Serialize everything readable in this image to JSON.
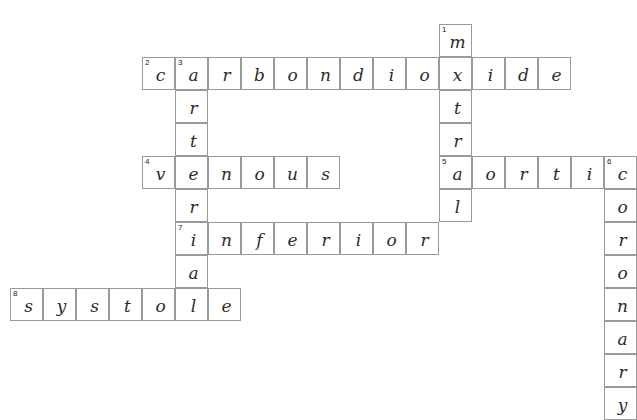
{
  "puzzle": {
    "title": "Cardiovascular crossword grid",
    "cell_size": 33,
    "grid_color": "#9a9a9a",
    "letter_color": "#2b2b2b",
    "background": "#ffffff",
    "entries": [
      {
        "number": 1,
        "direction": "down",
        "answer": "mitral",
        "start": {
          "col": 9,
          "row": 0
        }
      },
      {
        "number": 2,
        "direction": "across",
        "answer": "carbondioxide",
        "start": {
          "col": 0,
          "row": 1
        }
      },
      {
        "number": 3,
        "direction": "down",
        "answer": "arterial",
        "start": {
          "col": 1,
          "row": 1
        }
      },
      {
        "number": 4,
        "direction": "across",
        "answer": "venous",
        "start": {
          "col": 0,
          "row": 4
        }
      },
      {
        "number": 5,
        "direction": "across",
        "answer": "aortic",
        "start": {
          "col": 9,
          "row": 4
        }
      },
      {
        "number": 6,
        "direction": "down",
        "answer": "coronary",
        "start": {
          "col": 13,
          "row": 4
        }
      },
      {
        "number": 7,
        "direction": "across",
        "answer": "inferior",
        "start": {
          "col": 1,
          "row": 6
        }
      },
      {
        "number": 8,
        "direction": "across",
        "answer": "systole",
        "start": {
          "col": -4,
          "row": 8
        }
      }
    ],
    "cells": [
      {
        "col": 9,
        "row": 0,
        "letter": "m",
        "number": 1
      },
      {
        "col": 0,
        "row": 1,
        "letter": "c",
        "number": 2
      },
      {
        "col": 1,
        "row": 1,
        "letter": "a",
        "number": 3
      },
      {
        "col": 2,
        "row": 1,
        "letter": "r",
        "number": null
      },
      {
        "col": 3,
        "row": 1,
        "letter": "b",
        "number": null
      },
      {
        "col": 4,
        "row": 1,
        "letter": "o",
        "number": null
      },
      {
        "col": 5,
        "row": 1,
        "letter": "n",
        "number": null
      },
      {
        "col": 6,
        "row": 1,
        "letter": "d",
        "number": null
      },
      {
        "col": 7,
        "row": 1,
        "letter": "i",
        "number": null
      },
      {
        "col": 8,
        "row": 1,
        "letter": "o",
        "number": null
      },
      {
        "col": 9,
        "row": 1,
        "letter": "x",
        "number": null
      },
      {
        "col": 10,
        "row": 1,
        "letter": "i",
        "number": null
      },
      {
        "col": 11,
        "row": 1,
        "letter": "d",
        "number": null
      },
      {
        "col": 12,
        "row": 1,
        "letter": "e",
        "number": null
      },
      {
        "col": 1,
        "row": 2,
        "letter": "r",
        "number": null
      },
      {
        "col": 9,
        "row": 2,
        "letter": "t",
        "number": null
      },
      {
        "col": 1,
        "row": 3,
        "letter": "t",
        "number": null
      },
      {
        "col": 9,
        "row": 3,
        "letter": "r",
        "number": null
      },
      {
        "col": 0,
        "row": 4,
        "letter": "v",
        "number": 4
      },
      {
        "col": 1,
        "row": 4,
        "letter": "e",
        "number": null
      },
      {
        "col": 2,
        "row": 4,
        "letter": "n",
        "number": null
      },
      {
        "col": 3,
        "row": 4,
        "letter": "o",
        "number": null
      },
      {
        "col": 4,
        "row": 4,
        "letter": "u",
        "number": null
      },
      {
        "col": 5,
        "row": 4,
        "letter": "s",
        "number": null
      },
      {
        "col": 9,
        "row": 4,
        "letter": "a",
        "number": 5
      },
      {
        "col": 10,
        "row": 4,
        "letter": "o",
        "number": null
      },
      {
        "col": 11,
        "row": 4,
        "letter": "r",
        "number": null
      },
      {
        "col": 12,
        "row": 4,
        "letter": "t",
        "number": null
      },
      {
        "col": 13,
        "row": 4,
        "letter": "i",
        "number": null
      },
      {
        "col": 14,
        "row": 4,
        "letter": "c",
        "number": 6
      },
      {
        "col": 1,
        "row": 5,
        "letter": "r",
        "number": null
      },
      {
        "col": 9,
        "row": 5,
        "letter": "l",
        "number": null
      },
      {
        "col": 14,
        "row": 5,
        "letter": "o",
        "number": null
      },
      {
        "col": 1,
        "row": 6,
        "letter": "i",
        "number": 7
      },
      {
        "col": 2,
        "row": 6,
        "letter": "n",
        "number": null
      },
      {
        "col": 3,
        "row": 6,
        "letter": "f",
        "number": null
      },
      {
        "col": 4,
        "row": 6,
        "letter": "e",
        "number": null
      },
      {
        "col": 5,
        "row": 6,
        "letter": "r",
        "number": null
      },
      {
        "col": 6,
        "row": 6,
        "letter": "i",
        "number": null
      },
      {
        "col": 7,
        "row": 6,
        "letter": "o",
        "number": null
      },
      {
        "col": 8,
        "row": 6,
        "letter": "r",
        "number": null
      },
      {
        "col": 14,
        "row": 6,
        "letter": "r",
        "number": null
      },
      {
        "col": 1,
        "row": 7,
        "letter": "a",
        "number": null
      },
      {
        "col": 14,
        "row": 7,
        "letter": "o",
        "number": null
      },
      {
        "col": -4,
        "row": 8,
        "letter": "s",
        "number": 8
      },
      {
        "col": -3,
        "row": 8,
        "letter": "y",
        "number": null
      },
      {
        "col": -2,
        "row": 8,
        "letter": "s",
        "number": null
      },
      {
        "col": -1,
        "row": 8,
        "letter": "t",
        "number": null
      },
      {
        "col": 0,
        "row": 8,
        "letter": "o",
        "number": null
      },
      {
        "col": 1,
        "row": 8,
        "letter": "l",
        "number": null
      },
      {
        "col": 2,
        "row": 8,
        "letter": "e",
        "number": null
      },
      {
        "col": 14,
        "row": 8,
        "letter": "n",
        "number": null
      },
      {
        "col": 14,
        "row": 9,
        "letter": "a",
        "number": null
      },
      {
        "col": 14,
        "row": 10,
        "letter": "r",
        "number": null
      },
      {
        "col": 14,
        "row": 11,
        "letter": "y",
        "number": null
      }
    ]
  }
}
